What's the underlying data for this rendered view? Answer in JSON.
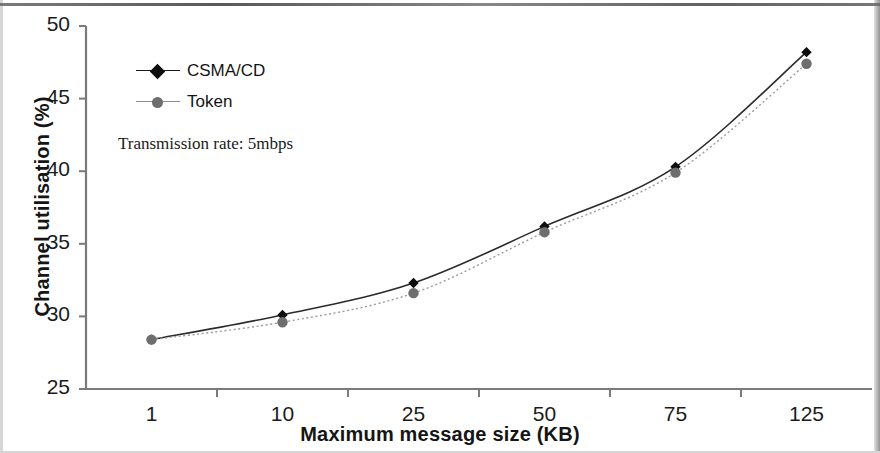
{
  "chart_data": {
    "type": "line",
    "title": "",
    "xlabel": "Maximum message size (KB)",
    "ylabel": "Channel  utilisation (%)",
    "categories": [
      "1",
      "10",
      "25",
      "50",
      "75",
      "125"
    ],
    "x_tick_labels": [
      "1",
      "10",
      "25",
      "50",
      "75",
      "125"
    ],
    "y_tick_labels": [
      "50",
      "45",
      "40",
      "35",
      "30",
      "25"
    ],
    "y_ticks": [
      50,
      45,
      40,
      35,
      30,
      25
    ],
    "ylim": [
      25,
      50
    ],
    "grid": false,
    "legend_position": "upper-left-inside",
    "annotation": "Transmission rate: 5mbps",
    "series": [
      {
        "name": "CSMA/CD",
        "values": [
          28.4,
          30.1,
          32.3,
          36.2,
          40.3,
          48.2
        ],
        "color": "#0d0d0d",
        "marker": "diamond",
        "line_style": "solid"
      },
      {
        "name": "Token",
        "values": [
          28.4,
          29.6,
          31.6,
          35.8,
          39.9,
          47.4
        ],
        "color": "#6e6e6e",
        "marker": "circle",
        "line_style": "dotted"
      }
    ]
  },
  "colors": {
    "csma_cd": "#0d0d0d",
    "token": "#6e6e6e",
    "axis": "#777777",
    "text": "#151515",
    "background": "#ffffff"
  }
}
